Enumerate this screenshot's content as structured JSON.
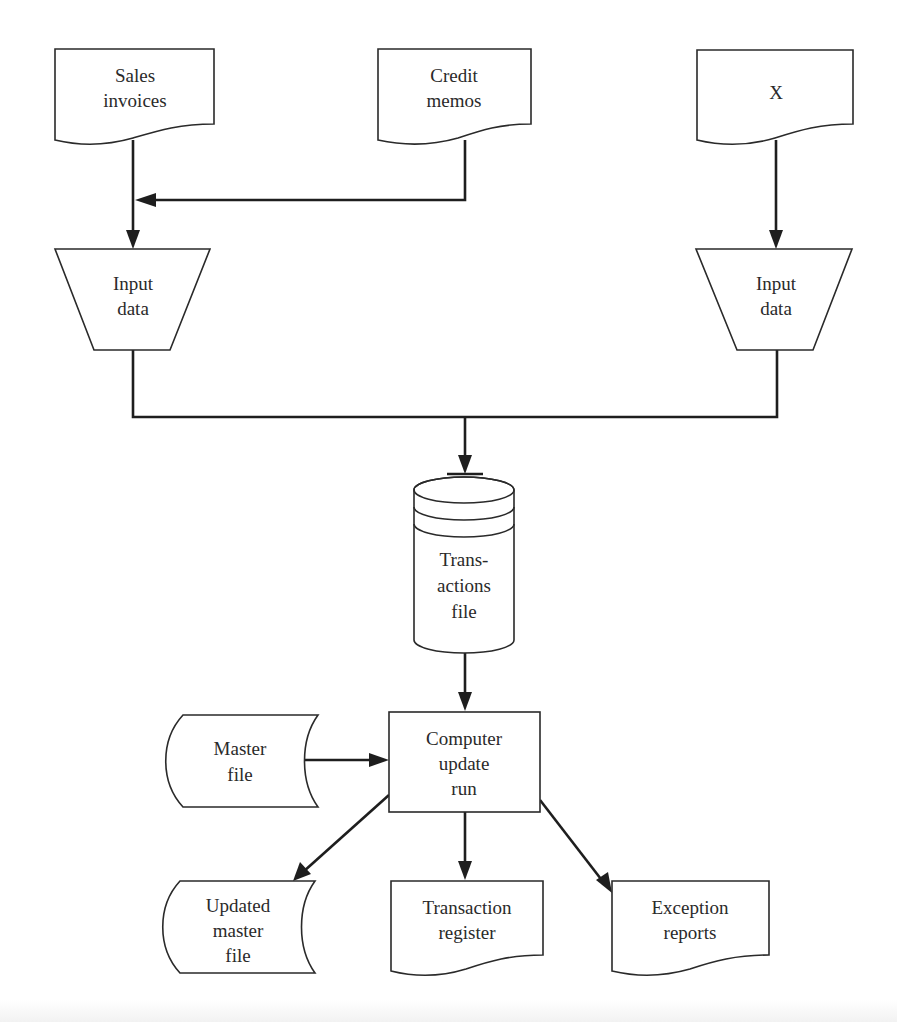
{
  "diagram": {
    "type": "system-flowchart",
    "nodes": [
      {
        "id": "sales_invoices",
        "shape": "document",
        "lines": [
          "Sales",
          "invoices"
        ]
      },
      {
        "id": "credit_memos",
        "shape": "document",
        "lines": [
          "Credit",
          "memos"
        ]
      },
      {
        "id": "x_doc",
        "shape": "document",
        "lines": [
          "X"
        ]
      },
      {
        "id": "input_left",
        "shape": "manual-operation",
        "lines": [
          "Input",
          "data"
        ]
      },
      {
        "id": "input_right",
        "shape": "manual-operation",
        "lines": [
          "Input",
          "data"
        ]
      },
      {
        "id": "transactions_file",
        "shape": "disk-storage",
        "lines": [
          "Trans-",
          "actions",
          "file"
        ]
      },
      {
        "id": "master_file",
        "shape": "tape-storage",
        "lines": [
          "Master",
          "file"
        ]
      },
      {
        "id": "computer_update_run",
        "shape": "process",
        "lines": [
          "Computer",
          "update",
          "run"
        ]
      },
      {
        "id": "updated_master_file",
        "shape": "tape-storage",
        "lines": [
          "Updated",
          "master",
          "file"
        ]
      },
      {
        "id": "transaction_register",
        "shape": "document",
        "lines": [
          "Transaction",
          "register"
        ]
      },
      {
        "id": "exception_reports",
        "shape": "document",
        "lines": [
          "Exception",
          "reports"
        ]
      }
    ],
    "edges": [
      {
        "from": "sales_invoices",
        "to": "input_left"
      },
      {
        "from": "credit_memos",
        "to": "input_left"
      },
      {
        "from": "x_doc",
        "to": "input_right"
      },
      {
        "from": "input_left",
        "to": "transactions_file"
      },
      {
        "from": "input_right",
        "to": "transactions_file"
      },
      {
        "from": "transactions_file",
        "to": "computer_update_run"
      },
      {
        "from": "master_file",
        "to": "computer_update_run"
      },
      {
        "from": "computer_update_run",
        "to": "updated_master_file"
      },
      {
        "from": "computer_update_run",
        "to": "transaction_register"
      },
      {
        "from": "computer_update_run",
        "to": "exception_reports"
      }
    ]
  },
  "labels": {
    "sales_invoices": {
      "l1": "Sales",
      "l2": "invoices"
    },
    "credit_memos": {
      "l1": "Credit",
      "l2": "memos"
    },
    "x_doc": {
      "l1": "X"
    },
    "input_left": {
      "l1": "Input",
      "l2": "data"
    },
    "input_right": {
      "l1": "Input",
      "l2": "data"
    },
    "transactions_file": {
      "l1": "Trans-",
      "l2": "actions",
      "l3": "file"
    },
    "master_file": {
      "l1": "Master",
      "l2": "file"
    },
    "computer_update_run": {
      "l1": "Computer",
      "l2": "update",
      "l3": "run"
    },
    "updated_master_file": {
      "l1": "Updated",
      "l2": "master",
      "l3": "file"
    },
    "transaction_register": {
      "l1": "Transaction",
      "l2": "register"
    },
    "exception_reports": {
      "l1": "Exception",
      "l2": "reports"
    }
  },
  "colors": {
    "background": "#ffffff",
    "stroke": "#2a2a2a",
    "text": "#2a2a2a"
  }
}
